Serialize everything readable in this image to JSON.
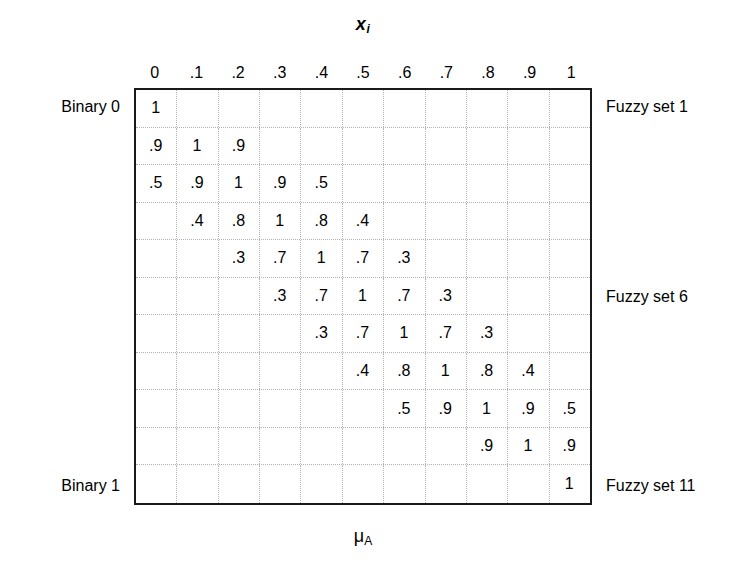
{
  "figure": {
    "top_axis_label": "x",
    "top_axis_label_sub": "i",
    "bottom_axis_label": "μ",
    "bottom_axis_label_sub": "A"
  },
  "left_labels": [
    {
      "text": "Binary 0",
      "row": 1
    },
    {
      "text": "Binary 1",
      "row": 11
    }
  ],
  "right_labels": [
    {
      "text": "Fuzzy set 1",
      "row": 1
    },
    {
      "text": "Fuzzy set 6",
      "row": 6
    },
    {
      "text": "Fuzzy set 11",
      "row": 11
    }
  ],
  "chart_data": {
    "type": "heatmap",
    "title": "",
    "xlabel": "x_i",
    "ylabel": "μ_A",
    "grid": true,
    "legend": "none",
    "categories": [
      "0",
      ".1",
      ".2",
      ".3",
      ".4",
      ".5",
      ".6",
      ".7",
      ".8",
      ".9",
      "1"
    ],
    "row_names": [
      "Fuzzy set 1",
      "Fuzzy set 2",
      "Fuzzy set 3",
      "Fuzzy set 4",
      "Fuzzy set 5",
      "Fuzzy set 6",
      "Fuzzy set 7",
      "Fuzzy set 8",
      "Fuzzy set 9",
      "Fuzzy set 10",
      "Fuzzy set 11"
    ],
    "cells": [
      [
        "1",
        "",
        "",
        "",
        "",
        "",
        "",
        "",
        "",
        "",
        ""
      ],
      [
        ".9",
        "1",
        ".9",
        "",
        "",
        "",
        "",
        "",
        "",
        "",
        ""
      ],
      [
        ".5",
        ".9",
        "1",
        ".9",
        ".5",
        "",
        "",
        "",
        "",
        "",
        ""
      ],
      [
        "",
        ".4",
        ".8",
        "1",
        ".8",
        ".4",
        "",
        "",
        "",
        "",
        ""
      ],
      [
        "",
        "",
        ".3",
        ".7",
        "1",
        ".7",
        ".3",
        "",
        "",
        "",
        ""
      ],
      [
        "",
        "",
        "",
        ".3",
        ".7",
        "1",
        ".7",
        ".3",
        "",
        "",
        ""
      ],
      [
        "",
        "",
        "",
        "",
        ".3",
        ".7",
        "1",
        ".7",
        ".3",
        "",
        ""
      ],
      [
        "",
        "",
        "",
        "",
        "",
        ".4",
        ".8",
        "1",
        ".8",
        ".4",
        ""
      ],
      [
        "",
        "",
        "",
        "",
        "",
        "",
        ".5",
        ".9",
        "1",
        ".9",
        ".5"
      ],
      [
        "",
        "",
        "",
        "",
        "",
        "",
        "",
        "",
        ".9",
        "1",
        ".9"
      ],
      [
        "",
        "",
        "",
        "",
        "",
        "",
        "",
        "",
        "",
        "",
        "1"
      ]
    ]
  }
}
